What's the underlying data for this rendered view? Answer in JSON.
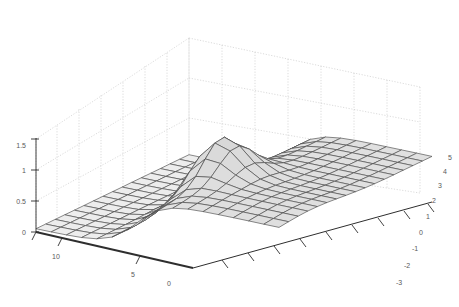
{
  "figure": {
    "title": "",
    "background": "#ffffff",
    "mesh_line_color": "#4a4a4a",
    "face_color": "#e9e9e9",
    "grid_color": "#b9b9b9",
    "axis_color": "#3a3a3a"
  },
  "chart_data": {
    "type": "surface",
    "title": "",
    "xlabel": "",
    "ylabel": "",
    "zlabel": "",
    "grid": true,
    "legend": null,
    "projection": "3d-mesh",
    "shading": "faceted-gray",
    "x": {
      "name": "x-axis",
      "ticks": [
        0,
        5,
        10
      ],
      "tick_labels": [
        "0",
        "5",
        "10"
      ],
      "range": [
        0,
        12
      ],
      "direction": "right-to-left-front"
    },
    "y": {
      "name": "y-axis",
      "ticks": [
        -3,
        -2,
        -1,
        0,
        1,
        2,
        3,
        4,
        5
      ],
      "tick_labels": [
        "-3",
        "-2",
        "-1",
        "0",
        "1",
        "2",
        "3",
        "4",
        "5"
      ],
      "range": [
        -3,
        5
      ],
      "direction": "front-bottom-to-back-top-right"
    },
    "z": {
      "name": "z-axis",
      "ticks": [
        0,
        0.5,
        1,
        1.5
      ],
      "tick_labels": [
        "0",
        "0.5",
        "1",
        "1.5"
      ],
      "range": [
        0,
        1.7
      ],
      "direction": "vertical-left"
    },
    "surface_description": "Sigmoidal step surface rising from a low flat plain at the front-left to an elevated plateau at the right, with a sharp narrow peak near the middle-back where the ridge crests above 1.5.",
    "grid_divisions": {
      "nx": 16,
      "ny": 16
    },
    "features": [
      {
        "name": "low-plateau",
        "approx_z": 0.05,
        "location": "front-left"
      },
      {
        "name": "ridge-cliff",
        "approx_z": 0.9,
        "location": "center-diagonal"
      },
      {
        "name": "central-peak",
        "approx_z": 1.62,
        "location": "center-back"
      },
      {
        "name": "high-plateau",
        "approx_z": 0.95,
        "location": "right"
      }
    ]
  }
}
